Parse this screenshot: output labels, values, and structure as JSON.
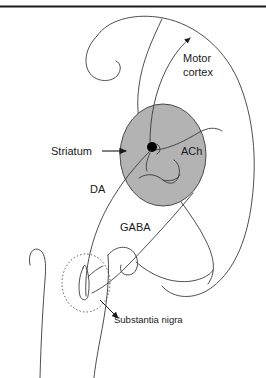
{
  "figure": {
    "background_color": "#ffffff",
    "stroke_color": "#3a3a3a",
    "text_color": "#1a1a1a",
    "top_rule_color": "#1a1a1a"
  },
  "labels": {
    "motor_cortex_line1": "Motor",
    "motor_cortex_line2": "cortex",
    "striatum": "Striatum",
    "ach": "ACh",
    "da": "DA",
    "gaba": "GABA",
    "substantia_nigra": "Substantia nigra"
  },
  "regions": {
    "striatum": {
      "name": "Striatum",
      "shape": "ellipse",
      "fill_color": "#b3b3b3",
      "stroke_color": "#3a3a3a",
      "center_x": 163,
      "center_y": 155,
      "radius_x": 43,
      "radius_y": 51
    },
    "substantia_nigra": {
      "name": "Substantia nigra",
      "shape": "dashed-ellipse",
      "fill_color": "none",
      "stroke_color": "#3a3a3a",
      "center_x": 86,
      "center_y": 283,
      "radius_x": 24,
      "radius_y": 29
    }
  },
  "neurons": {
    "striatal_soma": {
      "name": "striatal-neuron-soma",
      "fill_color": "#000000",
      "center_x": 152,
      "center_y": 147,
      "radius": 5
    }
  },
  "pathways": [
    {
      "name": "DA",
      "label": "DA",
      "from": "Substantia nigra",
      "to": "Striatum"
    },
    {
      "name": "GABA",
      "label": "GABA",
      "from": "Striatum",
      "to": "Substantia nigra"
    },
    {
      "name": "ACh",
      "label": "ACh",
      "from": "Striatum interneuron",
      "to": "Striatum"
    }
  ],
  "annotations": {
    "striatum_pointer": "arrow pointing right to striatum",
    "motor_cortex_pointer": "arrow pointing up-left to motor cortex",
    "substantia_nigra_pointer": "leader line to substantia nigra"
  }
}
